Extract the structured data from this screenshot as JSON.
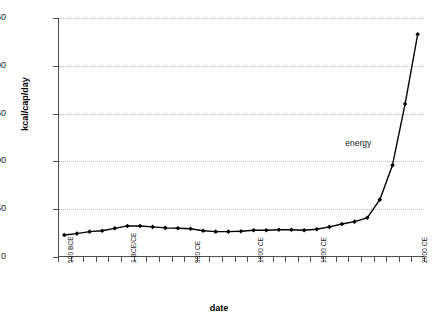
{
  "chart_data": {
    "type": "line",
    "title": "",
    "xlabel": "date",
    "ylabel": "kcal/cap/day",
    "ylim": [
      0,
      250
    ],
    "ytick_values": [
      0,
      50,
      100,
      150,
      200,
      250
    ],
    "ytick_labels": [
      "0",
      "50",
      "100",
      "150",
      "200",
      "250"
    ],
    "grid": "horizontal-dotted",
    "legend": "none",
    "annotations": [
      {
        "text": "energy",
        "x_value": 1800,
        "y_value": 118
      }
    ],
    "xtick_labels": [
      "500 BCE",
      "1 BCE/CE",
      "500 CE",
      "1000 CE",
      "1500 CE",
      "2000 CE"
    ],
    "xtick_values": [
      -500,
      1,
      500,
      1000,
      1500,
      2000
    ],
    "x_category_step": 100,
    "series": [
      {
        "name": "energy",
        "marker": "diamond",
        "color": "#000000",
        "x": [
          -500,
          -400,
          -300,
          -200,
          -100,
          1,
          100,
          200,
          300,
          400,
          500,
          600,
          700,
          800,
          900,
          1000,
          1100,
          1200,
          1300,
          1400,
          1500,
          1600,
          1700,
          1750,
          1800,
          1850,
          1900,
          1950,
          2000
        ],
        "values": [
          23,
          24.5,
          26.5,
          27.5,
          30,
          32.5,
          32.5,
          31.5,
          30.5,
          30,
          29.5,
          27.5,
          26.5,
          26.5,
          27,
          28,
          28,
          28.5,
          28.5,
          28,
          29,
          31.5,
          34.5,
          37,
          41,
          60,
          96,
          160,
          233
        ]
      }
    ]
  }
}
